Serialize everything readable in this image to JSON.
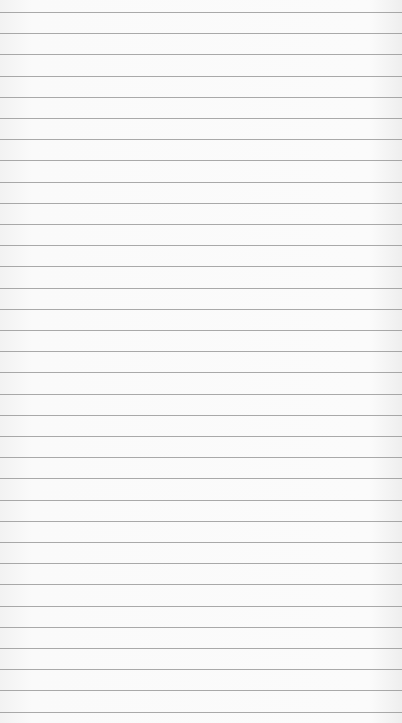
{
  "page": {
    "background_color": "#f7f7f7",
    "line_color": "#8e8e8e",
    "line_start_y": 12,
    "line_spacing": 21.2,
    "line_count": 34
  }
}
